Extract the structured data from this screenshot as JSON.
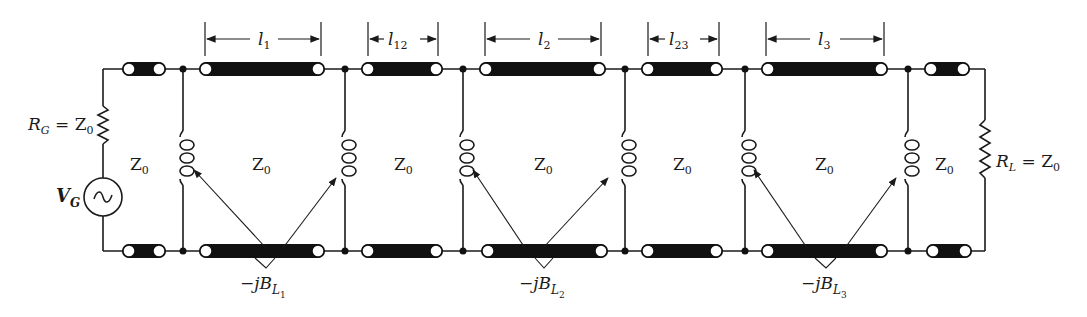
{
  "diagram": {
    "type": "circuit-schematic",
    "source": {
      "resistor_label": "R_G = Z_0",
      "resistor_label_parts": {
        "main": "R",
        "sub": "G",
        "eq": " = Z",
        "sub2": "0"
      },
      "voltage_label_parts": {
        "main": "V",
        "sub": "G"
      },
      "symbol": "~"
    },
    "load": {
      "resistor_label_parts": {
        "main": "R",
        "sub": "L",
        "eq": " = Z",
        "sub2": "0"
      }
    },
    "line_sections": [
      {
        "id": "l1",
        "label_main": "l",
        "label_sub": "1"
      },
      {
        "id": "l12",
        "label_main": "l",
        "label_sub": "12"
      },
      {
        "id": "l2",
        "label_main": "l",
        "label_sub": "2"
      },
      {
        "id": "l23",
        "label_main": "l",
        "label_sub": "23"
      },
      {
        "id": "l3",
        "label_main": "l",
        "label_sub": "3"
      }
    ],
    "impedance_labels": [
      {
        "main": "Z",
        "sub": "0"
      },
      {
        "main": "Z",
        "sub": "0"
      },
      {
        "main": "Z",
        "sub": "0"
      },
      {
        "main": "Z",
        "sub": "0"
      },
      {
        "main": "Z",
        "sub": "0"
      },
      {
        "main": "Z",
        "sub": "0"
      },
      {
        "main": "Z",
        "sub": "0"
      }
    ],
    "susceptances": [
      {
        "prefix": "−jB",
        "sub": "L",
        "subsub": "1"
      },
      {
        "prefix": "−jB",
        "sub": "L",
        "subsub": "2"
      },
      {
        "prefix": "−jB",
        "sub": "L",
        "subsub": "3"
      }
    ],
    "colors": {
      "line": "#1a1a1a",
      "fill": "#111111",
      "background": "#ffffff"
    }
  }
}
